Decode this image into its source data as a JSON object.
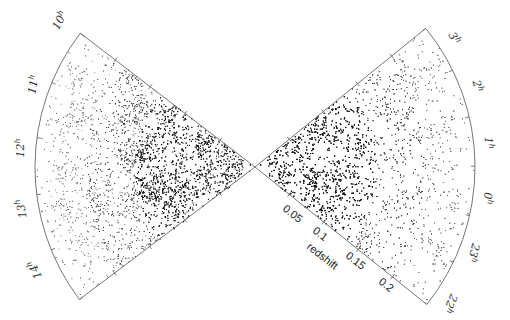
{
  "chart_data": {
    "type": "scatter",
    "subtype": "redshift-cone-diagram",
    "title": "",
    "xlabel": "redshift",
    "radial_axis": {
      "label": "redshift",
      "ticks": [
        0.05,
        0.1,
        0.15,
        0.2
      ],
      "tick_labels": [
        "0.05",
        "0.1",
        "0.15",
        "0.2"
      ],
      "range": [
        0,
        0.25
      ]
    },
    "left_wedge": {
      "name": "NGP strip",
      "angular_labels": [
        "10h",
        "11h",
        "12h",
        "13h",
        "14h"
      ],
      "ra_range_hours": [
        10,
        14.3
      ]
    },
    "right_wedge": {
      "name": "SGP strip",
      "angular_labels": [
        "3h",
        "2h",
        "1h",
        "0h",
        "23h",
        "22h"
      ],
      "ra_range_hours": [
        21.8,
        3.4
      ]
    }
  },
  "labels": {
    "left": [
      {
        "text": "10",
        "sup": "h",
        "x": 63,
        "y": 22,
        "rot": -62
      },
      {
        "text": "11",
        "sup": "h",
        "x": 37,
        "y": 85,
        "rot": -80
      },
      {
        "text": "12",
        "sup": "h",
        "x": 24,
        "y": 148,
        "rot": -90
      },
      {
        "text": "13",
        "sup": "h",
        "x": 25,
        "y": 208,
        "rot": -100
      },
      {
        "text": "14",
        "sup": "h",
        "x": 38,
        "y": 268,
        "rot": -115
      }
    ],
    "right": [
      {
        "text": "3",
        "sup": "h",
        "x": 451,
        "y": 40,
        "rot": 60
      },
      {
        "text": "2",
        "sup": "h",
        "x": 474,
        "y": 87,
        "rot": 75
      },
      {
        "text": "1",
        "sup": "h",
        "x": 485,
        "y": 143,
        "rot": 88
      },
      {
        "text": "0",
        "sup": "h",
        "x": 484,
        "y": 198,
        "rot": 95
      },
      {
        "text": "23",
        "sup": "h",
        "x": 470,
        "y": 252,
        "rot": 105
      },
      {
        "text": "22",
        "sup": "h",
        "x": 447,
        "y": 302,
        "rot": 115
      }
    ],
    "redshift_ticks": [
      {
        "text": "0.05",
        "x": 282,
        "y": 210
      },
      {
        "text": "0.1",
        "x": 312,
        "y": 232
      },
      {
        "text": "0.15",
        "x": 345,
        "y": 257
      },
      {
        "text": "0.2",
        "x": 378,
        "y": 283
      }
    ],
    "redshift_axis_label": {
      "text": "redshift",
      "x": 306,
      "y": 248
    }
  }
}
